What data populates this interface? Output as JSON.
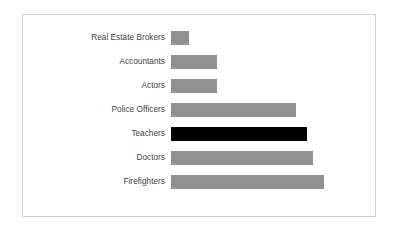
{
  "chart_data": {
    "type": "bar",
    "orientation": "horizontal",
    "title": "",
    "subtitle": "",
    "xlabel": "",
    "ylabel": "",
    "grid": false,
    "legend": "none",
    "axis_visible": false,
    "tick_labels_visible": false,
    "xlim": [
      0,
      100
    ],
    "categories": [
      "Real Estate Brokers",
      "Accountants",
      "Actors",
      "Police Officers",
      "Teachers",
      "Doctors",
      "Firefighters"
    ],
    "values": [
      12,
      30,
      30,
      82,
      89,
      93,
      100
    ],
    "bar_colors": [
      "#919191",
      "#919191",
      "#919191",
      "#919191",
      "#000000",
      "#919191",
      "#919191"
    ],
    "highlighted_category": "Teachers",
    "colors": {
      "bar_default": "#919191",
      "bar_highlight": "#000000",
      "label_text": "#404040",
      "frame_border": "#d2d2d2",
      "background": "#ffffff"
    }
  }
}
